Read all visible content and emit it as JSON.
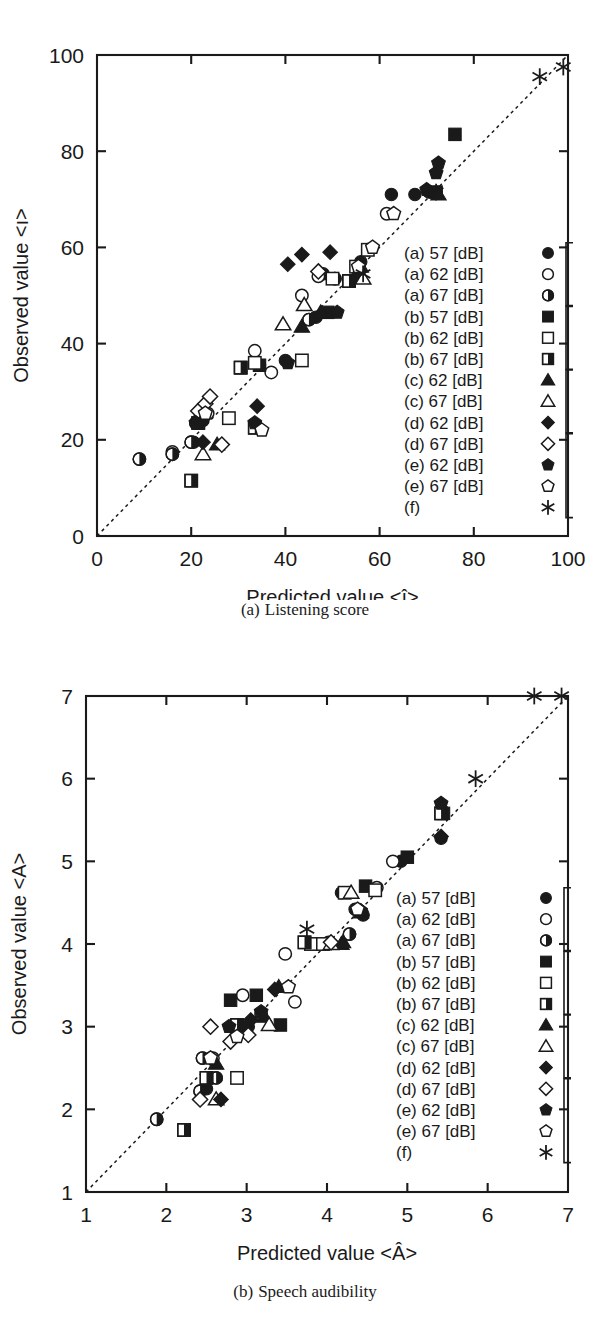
{
  "figures": [
    {
      "id": "a",
      "caption_index": "(a)",
      "caption_text": "Listening score",
      "ylabel": "Observed value <ı>",
      "xlabel": "Predicted value <î>",
      "xticks": [
        "0",
        "20",
        "40",
        "60",
        "80",
        "100"
      ],
      "yticks": [
        "0",
        "20",
        "40",
        "60",
        "80",
        "100"
      ]
    },
    {
      "id": "b",
      "caption_index": "(b)",
      "caption_text": "Speech audibility",
      "ylabel": "Observed value <A>",
      "xlabel": "Predicted value <Â>",
      "xticks": [
        "1",
        "2",
        "3",
        "4",
        "5",
        "6",
        "7"
      ],
      "yticks": [
        "1",
        "2",
        "3",
        "4",
        "5",
        "6",
        "7"
      ]
    }
  ],
  "legend": {
    "entries": [
      {
        "label": "(a)  57 [dB]",
        "marker": "circle-filled"
      },
      {
        "label": "(a)  62 [dB]",
        "marker": "circle-open"
      },
      {
        "label": "(a)  67 [dB]",
        "marker": "circle-half"
      },
      {
        "label": "(b)  57 [dB]",
        "marker": "square-filled"
      },
      {
        "label": "(b)  62 [dB]",
        "marker": "square-open"
      },
      {
        "label": "(b)  67 [dB]",
        "marker": "square-half"
      },
      {
        "label": "(c)  62 [dB]",
        "marker": "triangle-filled"
      },
      {
        "label": "(c)  67 [dB]",
        "marker": "triangle-open"
      },
      {
        "label": "(d)  62 [dB]",
        "marker": "diamond-filled"
      },
      {
        "label": "(d)  67 [dB]",
        "marker": "diamond-open"
      },
      {
        "label": "(e)  62 [dB]",
        "marker": "pentagon-filled"
      },
      {
        "label": "(e)  67 [dB]",
        "marker": "pentagon-open"
      },
      {
        "label": "(f)",
        "marker": "asterisk"
      }
    ],
    "group_braces": [
      {
        "from": 0,
        "to": 2
      },
      {
        "from": 3,
        "to": 5
      },
      {
        "from": 6,
        "to": 8
      },
      {
        "from": 9,
        "to": 12
      }
    ]
  },
  "chart_data": [
    {
      "type": "scatter",
      "id": "listening-score",
      "title": "(a) Listening score",
      "xlabel": "Predicted value <î>",
      "ylabel": "Observed value <ı>",
      "xlim": [
        0,
        100
      ],
      "ylim": [
        0,
        100
      ],
      "xticks": [
        0,
        20,
        40,
        60,
        80,
        100
      ],
      "yticks": [
        0,
        20,
        40,
        60,
        80,
        100
      ],
      "grid": false,
      "legend_position": "inside-right",
      "reference_line": {
        "type": "identity",
        "style": "dashed",
        "from": [
          0,
          0
        ],
        "to": [
          100,
          100
        ]
      },
      "series": [
        {
          "name": "(a) 57 [dB]",
          "marker": "circle-filled",
          "points": [
            [
              20.5,
              19.5
            ],
            [
              22.5,
              24.0
            ],
            [
              34.5,
              35.5
            ],
            [
              40.0,
              36.5
            ],
            [
              46.5,
              45.5
            ],
            [
              48.0,
              54.5
            ],
            [
              56.0,
              57.0
            ],
            [
              62.5,
              71.0
            ],
            [
              67.5,
              71.0
            ],
            [
              70.5,
              71.5
            ],
            [
              72.0,
              71.5
            ]
          ]
        },
        {
          "name": "(a) 62 [dB]",
          "marker": "circle-open",
          "points": [
            [
              16.0,
              17.5
            ],
            [
              22.0,
              26.0
            ],
            [
              23.5,
              25.5
            ],
            [
              33.5,
              38.5
            ],
            [
              37.0,
              34.0
            ],
            [
              43.5,
              50.0
            ],
            [
              47.0,
              54.0
            ],
            [
              57.5,
              59.5
            ],
            [
              61.5,
              67.0
            ]
          ]
        },
        {
          "name": "(a) 67 [dB]",
          "marker": "circle-half",
          "points": [
            [
              9.0,
              16.0
            ],
            [
              16.0,
              17.0
            ],
            [
              20.0,
              19.5
            ],
            [
              21.5,
              24.0
            ],
            [
              21.0,
              23.5
            ],
            [
              45.0,
              45.0
            ],
            [
              50.5,
              53.5
            ]
          ]
        },
        {
          "name": "(b) 57 [dB]",
          "marker": "square-filled",
          "points": [
            [
              30.5,
              35.0
            ],
            [
              34.5,
              35.5
            ],
            [
              49.0,
              46.5
            ],
            [
              53.5,
              53.0
            ],
            [
              55.5,
              54.0
            ],
            [
              72.0,
              71.5
            ],
            [
              76.0,
              83.5
            ]
          ]
        },
        {
          "name": "(b) 62 [dB]",
          "marker": "square-open",
          "points": [
            [
              28.0,
              24.5
            ],
            [
              33.5,
              36.0
            ],
            [
              43.5,
              36.5
            ],
            [
              50.0,
              53.5
            ],
            [
              55.0,
              56.0
            ],
            [
              57.5,
              59.5
            ]
          ]
        },
        {
          "name": "(b) 67 [dB]",
          "marker": "square-half",
          "points": [
            [
              20.0,
              11.5
            ],
            [
              21.5,
              23.5
            ],
            [
              30.5,
              35.0
            ],
            [
              33.5,
              22.5
            ],
            [
              53.5,
              53.0
            ]
          ]
        },
        {
          "name": "(c) 62 [dB]",
          "marker": "triangle-filled",
          "points": [
            [
              25.5,
              19.0
            ],
            [
              43.5,
              43.5
            ],
            [
              47.5,
              46.5
            ],
            [
              56.0,
              56.0
            ],
            [
              72.5,
              71.0
            ]
          ]
        },
        {
          "name": "(c) 67 [dB]",
          "marker": "triangle-open",
          "points": [
            [
              22.5,
              17.0
            ],
            [
              39.5,
              44.0
            ],
            [
              44.0,
              48.0
            ],
            [
              56.5,
              53.5
            ]
          ]
        },
        {
          "name": "(d) 62 [dB]",
          "marker": "diamond-filled",
          "points": [
            [
              22.5,
              19.5
            ],
            [
              34.0,
              27.0
            ],
            [
              40.5,
              56.5
            ],
            [
              43.5,
              58.5
            ],
            [
              49.5,
              59.0
            ]
          ]
        },
        {
          "name": "(d) 67 [dB]",
          "marker": "diamond-open",
          "points": [
            [
              21.5,
              26.0
            ],
            [
              23.0,
              27.5
            ],
            [
              24.0,
              29.0
            ],
            [
              26.5,
              19.0
            ],
            [
              47.0,
              55.0
            ]
          ]
        },
        {
          "name": "(e) 62 [dB]",
          "marker": "pentagon-filled",
          "points": [
            [
              21.0,
              23.5
            ],
            [
              33.5,
              23.5
            ],
            [
              40.5,
              36.0
            ],
            [
              51.0,
              46.5
            ],
            [
              70.0,
              72.0
            ],
            [
              72.0,
              75.5
            ],
            [
              72.5,
              77.5
            ]
          ]
        },
        {
          "name": "(e) 67 [dB]",
          "marker": "pentagon-open",
          "points": [
            [
              23.0,
              25.5
            ],
            [
              35.0,
              22.0
            ],
            [
              55.5,
              56.0
            ],
            [
              58.5,
              60.0
            ],
            [
              63.0,
              67.0
            ]
          ]
        },
        {
          "name": "(f)",
          "marker": "asterisk",
          "points": [
            [
              56.5,
              54.5
            ],
            [
              72.0,
              71.5
            ],
            [
              94.0,
              95.5
            ],
            [
              99.0,
              97.5
            ]
          ]
        }
      ]
    },
    {
      "type": "scatter",
      "id": "speech-audibility",
      "title": "(b) Speech audibility",
      "xlabel": "Predicted value <Â>",
      "ylabel": "Observed value <A>",
      "xlim": [
        1,
        7
      ],
      "ylim": [
        1,
        7
      ],
      "xticks": [
        1,
        2,
        3,
        4,
        5,
        6,
        7
      ],
      "yticks": [
        1,
        2,
        3,
        4,
        5,
        6,
        7
      ],
      "grid": false,
      "legend_position": "inside-right",
      "reference_line": {
        "type": "identity",
        "style": "dashed",
        "from": [
          1,
          1
        ],
        "to": [
          7,
          7
        ]
      },
      "series": [
        {
          "name": "(a) 57 [dB]",
          "marker": "circle-filled",
          "points": [
            [
              2.5,
              2.25
            ],
            [
              2.55,
              2.62
            ],
            [
              3.02,
              3.0
            ],
            [
              4.18,
              4.62
            ],
            [
              4.35,
              4.42
            ],
            [
              4.45,
              4.35
            ],
            [
              4.92,
              5.0
            ],
            [
              5.42,
              5.28
            ]
          ]
        },
        {
          "name": "(a) 62 [dB]",
          "marker": "circle-open",
          "points": [
            [
              2.58,
              2.62
            ],
            [
              2.95,
              3.38
            ],
            [
              3.18,
              3.15
            ],
            [
              3.48,
              3.88
            ],
            [
              3.6,
              3.3
            ],
            [
              4.02,
              4.02
            ],
            [
              4.62,
              4.68
            ],
            [
              4.82,
              5.0
            ]
          ]
        },
        {
          "name": "(a) 67 [dB]",
          "marker": "circle-half",
          "points": [
            [
              1.88,
              1.88
            ],
            [
              2.42,
              2.22
            ],
            [
              2.45,
              2.62
            ],
            [
              2.62,
              2.38
            ],
            [
              4.28,
              4.12
            ]
          ]
        },
        {
          "name": "(b) 57 [dB]",
          "marker": "square-filled",
          "points": [
            [
              2.8,
              3.32
            ],
            [
              3.12,
              3.38
            ],
            [
              3.42,
              3.02
            ],
            [
              4.48,
              4.7
            ],
            [
              5.0,
              5.05
            ],
            [
              5.45,
              5.58
            ]
          ]
        },
        {
          "name": "(b) 62 [dB]",
          "marker": "square-open",
          "points": [
            [
              2.88,
              2.38
            ],
            [
              3.8,
              4.0
            ],
            [
              3.95,
              4.0
            ],
            [
              4.22,
              4.62
            ],
            [
              4.6,
              4.65
            ]
          ]
        },
        {
          "name": "(b) 67 [dB]",
          "marker": "square-half",
          "points": [
            [
              2.22,
              1.75
            ],
            [
              2.5,
              2.38
            ],
            [
              2.88,
              3.02
            ],
            [
              3.72,
              4.02
            ],
            [
              5.42,
              5.58
            ]
          ]
        },
        {
          "name": "(c) 62 [dB]",
          "marker": "triangle-filled",
          "points": [
            [
              2.62,
              2.55
            ],
            [
              3.22,
              3.12
            ],
            [
              3.4,
              3.48
            ],
            [
              4.18,
              4.0
            ],
            [
              4.2,
              4.02
            ],
            [
              4.42,
              4.38
            ]
          ]
        },
        {
          "name": "(c) 67 [dB]",
          "marker": "triangle-open",
          "points": [
            [
              2.62,
              2.12
            ],
            [
              3.28,
              3.02
            ],
            [
              4.05,
              4.0
            ],
            [
              4.3,
              4.62
            ]
          ]
        },
        {
          "name": "(d) 62 [dB]",
          "marker": "diamond-filled",
          "points": [
            [
              2.68,
              2.12
            ],
            [
              3.05,
              3.08
            ],
            [
              3.35,
              3.45
            ],
            [
              4.42,
              4.4
            ],
            [
              5.42,
              5.3
            ]
          ]
        },
        {
          "name": "(d) 67 [dB]",
          "marker": "diamond-open",
          "points": [
            [
              2.42,
              2.12
            ],
            [
              2.55,
              3.0
            ],
            [
              2.8,
              2.82
            ],
            [
              3.02,
              2.9
            ],
            [
              4.05,
              4.02
            ]
          ]
        },
        {
          "name": "(e) 62 [dB]",
          "marker": "pentagon-filled",
          "points": [
            [
              2.78,
              3.0
            ],
            [
              3.18,
              3.18
            ],
            [
              4.42,
              4.4
            ],
            [
              5.42,
              5.7
            ]
          ]
        },
        {
          "name": "(e) 67 [dB]",
          "marker": "pentagon-open",
          "points": [
            [
              2.55,
              2.62
            ],
            [
              2.88,
              2.88
            ],
            [
              3.52,
              3.48
            ],
            [
              4.38,
              4.42
            ]
          ]
        },
        {
          "name": "(f)",
          "marker": "asterisk",
          "points": [
            [
              3.75,
              4.18
            ],
            [
              5.85,
              6.0
            ],
            [
              6.58,
              7.0
            ],
            [
              6.92,
              7.0
            ]
          ]
        }
      ]
    }
  ]
}
